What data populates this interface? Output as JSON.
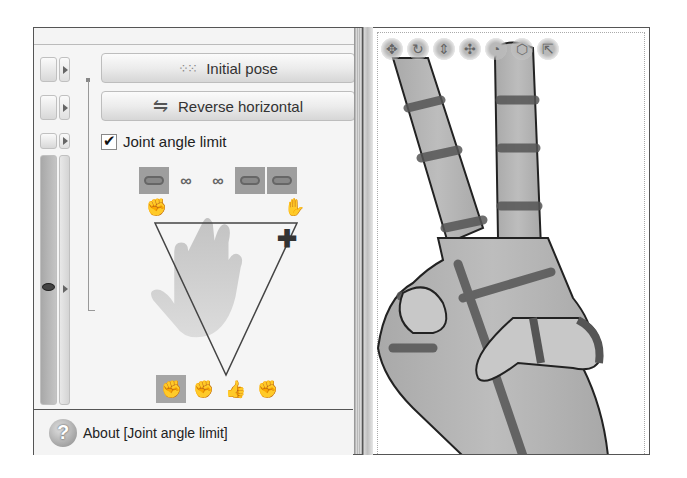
{
  "left_panel": {
    "header_text": "",
    "buttons": {
      "initial_pose": {
        "label": "Initial pose",
        "icon": "dots-ring-icon"
      },
      "reverse_horizontal": {
        "label": "Reverse horizontal",
        "icon": "flip-horizontal-icon"
      }
    },
    "joint_angle_limit": {
      "label": "Joint angle limit",
      "checked": true
    },
    "link_toggles": [
      {
        "icon": "linked-pill-icon",
        "active": true
      },
      {
        "icon": "chain-link-icon",
        "active": false
      },
      {
        "icon": "chain-link-icon",
        "active": false
      },
      {
        "icon": "linked-pill-icon",
        "active": true
      },
      {
        "icon": "linked-pill-icon",
        "active": true
      }
    ],
    "pose_area": {
      "left_icon": "closed-hand-icon",
      "right_icon": "open-hand-icon",
      "marker": "crosshair-marker"
    },
    "hand_pose_buttons": [
      {
        "icon": "fist-side-icon",
        "active": true
      },
      {
        "icon": "fist-front-icon",
        "active": false
      },
      {
        "icon": "fist-thumb-icon",
        "active": false
      },
      {
        "icon": "fist-back-icon",
        "active": false
      }
    ],
    "about": {
      "label": "About [Joint angle limit]"
    }
  },
  "viewport": {
    "tools": [
      "move-icon",
      "rotate-icon",
      "scale-icon",
      "pan-icon",
      "orbit-icon",
      "cube-icon",
      "reset-icon"
    ]
  },
  "colors": {
    "active_toggle": "#9e9e9e",
    "panel_bg": "#f5f5f5",
    "border": "#555555"
  }
}
